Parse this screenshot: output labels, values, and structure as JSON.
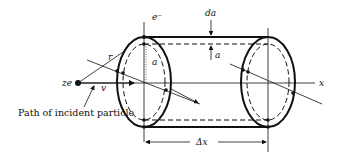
{
  "diagram": {
    "type": "physics-geometry",
    "labels": {
      "electron": "e⁻",
      "shell_thickness": "da",
      "radius_top": "a",
      "radius_inner": "a",
      "distance": "r",
      "charge": "ze",
      "velocity": "v",
      "axis": "x",
      "length": "Δx",
      "caption": "Path of incident particle"
    },
    "colors": {
      "line": "#111111",
      "background": "#ffffff"
    }
  }
}
